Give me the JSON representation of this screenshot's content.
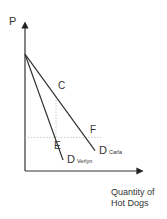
{
  "chart_data": {
    "type": "line",
    "title": "",
    "ylabel": "P",
    "xlabel": "Quantity of Hot Dogs",
    "xlabel_lines": [
      "Quantity of",
      "Hot Dogs"
    ],
    "grid": false,
    "legend": "none",
    "xlim": [
      0,
      10
    ],
    "ylim": [
      0,
      10
    ],
    "series": [
      {
        "name": "D Verlyn",
        "label_main": "D",
        "label_sub": "Verlyn",
        "points": [
          [
            0,
            8
          ],
          [
            3.8,
            0.75
          ]
        ]
      },
      {
        "name": "D Carla",
        "label_main": "D",
        "label_sub": "Carla",
        "points": [
          [
            0,
            8
          ],
          [
            7,
            1.4
          ]
        ]
      }
    ],
    "guides": [
      {
        "type": "horizontal",
        "y": 2.3,
        "style": "dotted"
      },
      {
        "type": "vertical",
        "x": 3.1,
        "from_y": 5.1,
        "to_y": 2.3,
        "style": "dotted"
      }
    ],
    "annotations": [
      {
        "text": "C",
        "x": 3.3,
        "y": 5.6
      },
      {
        "text": "E",
        "x": 2.9,
        "y": 1.5
      },
      {
        "text": "F",
        "x": 6.5,
        "y": 2.6
      }
    ]
  }
}
